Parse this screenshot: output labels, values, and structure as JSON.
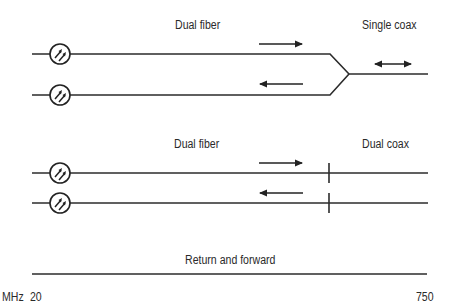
{
  "sections": [
    {
      "id": "top",
      "left_label": "Dual fiber",
      "right_label": "Single coax",
      "forward_arrow": "right",
      "return_arrow": "left",
      "coax_arrow": "bidirectional"
    },
    {
      "id": "middle",
      "left_label": "Dual fiber",
      "right_label": "Dual coax",
      "forward_arrow": "right",
      "return_arrow": "left"
    }
  ],
  "spectrum": {
    "label": "Return and forward",
    "unit": "MHz",
    "start": "20",
    "end": "750"
  },
  "icons": {
    "transmitter": "optical-transmitter-icon"
  },
  "colors": {
    "line": "#2b2b2b",
    "background": "#ffffff",
    "text": "#2a2a2a"
  }
}
